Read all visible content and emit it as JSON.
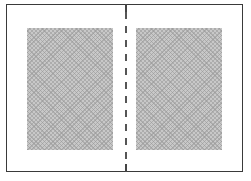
{
  "diagram": {
    "type": "two-page spread layout",
    "frame": {
      "border_color": "#3a3a3a",
      "background": "#ffffff"
    },
    "panels": [
      {
        "id": "left-page",
        "fill": "#c8c8c8",
        "pattern": "crosshatch"
      },
      {
        "id": "right-page",
        "fill": "#c8c8c8",
        "pattern": "crosshatch"
      }
    ],
    "divider": {
      "style": "dashed",
      "color": "#555555",
      "position": "center"
    }
  }
}
